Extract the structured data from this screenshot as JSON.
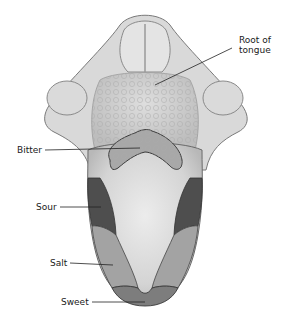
{
  "figure": {
    "colors": {
      "background": "#ffffff",
      "tongue_base": "#d6d6d6",
      "tongue_light": "#e6e6e6",
      "outline": "#5a5a5a",
      "bitter_region": "#a8a8a8",
      "sour_region": "#4e4e4e",
      "salt_region": "#a3a3a3",
      "sweet_region": "#7d7d7d",
      "leader_line": "#222222"
    }
  },
  "labels": {
    "root": {
      "line1": "Root of",
      "line2": "tongue"
    },
    "bitter": "Bitter",
    "sour": "Sour",
    "salt": "Salt",
    "sweet": "Sweet"
  }
}
